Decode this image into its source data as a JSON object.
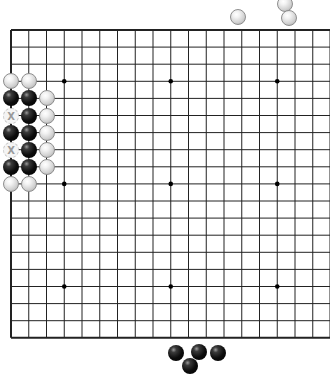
{
  "board": {
    "size": 19,
    "origin_x": 11,
    "origin_y": 30,
    "col_spacing": 17.75,
    "row_spacing": 17.1,
    "line_color": "#222222",
    "border_width": 2,
    "star_points": [
      [
        3,
        3
      ],
      [
        9,
        3
      ],
      [
        15,
        3
      ],
      [
        3,
        9
      ],
      [
        9,
        9
      ],
      [
        15,
        9
      ],
      [
        3,
        15
      ],
      [
        9,
        15
      ],
      [
        15,
        15
      ]
    ],
    "stones": [
      {
        "color": "white",
        "col": 0,
        "row": 3
      },
      {
        "color": "white",
        "col": 1,
        "row": 3
      },
      {
        "color": "black",
        "col": 0,
        "row": 4
      },
      {
        "color": "black",
        "col": 1,
        "row": 4
      },
      {
        "color": "white",
        "col": 2,
        "row": 4
      },
      {
        "color": "black",
        "col": 1,
        "row": 5
      },
      {
        "color": "white",
        "col": 2,
        "row": 5
      },
      {
        "color": "black",
        "col": 0,
        "row": 6
      },
      {
        "color": "black",
        "col": 1,
        "row": 6
      },
      {
        "color": "white",
        "col": 2,
        "row": 6
      },
      {
        "color": "black",
        "col": 1,
        "row": 7
      },
      {
        "color": "white",
        "col": 2,
        "row": 7
      },
      {
        "color": "black",
        "col": 0,
        "row": 8
      },
      {
        "color": "black",
        "col": 1,
        "row": 8
      },
      {
        "color": "white",
        "col": 2,
        "row": 8
      },
      {
        "color": "white",
        "col": 0,
        "row": 9
      },
      {
        "color": "white",
        "col": 1,
        "row": 9
      }
    ],
    "markers": [
      {
        "col": 0,
        "row": 5,
        "label": "X"
      },
      {
        "col": 0,
        "row": 7,
        "label": "X"
      }
    ]
  },
  "captured_white": [
    {
      "x": 238,
      "y": 17
    },
    {
      "x": 285,
      "y": 4
    },
    {
      "x": 289,
      "y": 18
    }
  ],
  "captured_black": [
    {
      "x": 176,
      "y": 353
    },
    {
      "x": 199,
      "y": 352
    },
    {
      "x": 218,
      "y": 353
    },
    {
      "x": 190,
      "y": 366
    }
  ]
}
